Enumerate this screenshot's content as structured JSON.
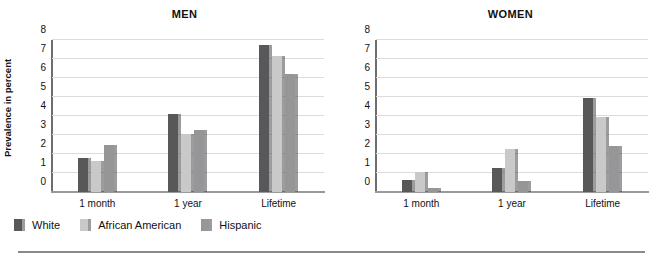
{
  "figure": {
    "panels": [
      "MEN",
      "WOMEN"
    ],
    "y_axis_title": "Prevalence in percent",
    "categories": [
      "1 month",
      "1 year",
      "Lifetime"
    ],
    "y_ticks": [
      "0",
      "1",
      "2",
      "3",
      "4",
      "5",
      "6",
      "7",
      "8"
    ]
  },
  "legend": {
    "items": [
      {
        "label": "White",
        "color": "#58585a"
      },
      {
        "label": "African American",
        "color": "#c9c9c9"
      },
      {
        "label": "Hispanic",
        "color": "#969698"
      }
    ]
  },
  "colors": {
    "white_series": "#58585a",
    "african_american_series": "#c9c9c9",
    "hispanic_series": "#969698",
    "gridline": "#dcdcdc",
    "axis": "#6e6e6e",
    "text": "#111111",
    "rule": "#8a8a8a"
  },
  "chart_data": [
    {
      "type": "bar",
      "title": "MEN",
      "xlabel": "",
      "ylabel": "Prevalence in percent",
      "ylim": [
        0,
        8
      ],
      "grid": true,
      "legend_position": "bottom",
      "categories": [
        "1 month",
        "1 year",
        "Lifetime"
      ],
      "series": [
        {
          "name": "White",
          "values": [
            1.8,
            4.1,
            7.75
          ]
        },
        {
          "name": "African American",
          "values": [
            1.65,
            3.05,
            7.15
          ]
        },
        {
          "name": "Hispanic",
          "values": [
            2.45,
            3.25,
            6.2
          ]
        }
      ]
    },
    {
      "type": "bar",
      "title": "WOMEN",
      "xlabel": "",
      "ylabel": "",
      "ylim": [
        0,
        8
      ],
      "grid": true,
      "legend_position": "bottom",
      "categories": [
        "1 month",
        "1 year",
        "Lifetime"
      ],
      "series": [
        {
          "name": "White",
          "values": [
            0.65,
            1.25,
            4.95
          ]
        },
        {
          "name": "African American",
          "values": [
            1.05,
            2.25,
            3.95
          ]
        },
        {
          "name": "Hispanic",
          "values": [
            0.2,
            0.6,
            2.4
          ]
        }
      ]
    }
  ]
}
